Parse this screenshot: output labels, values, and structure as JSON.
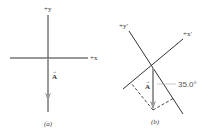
{
  "figure": {
    "panels": [
      {
        "id": "a",
        "caption": "(a)",
        "axes": {
          "y_label": "+y",
          "x_label": "+x"
        },
        "vector": {
          "label": "A",
          "arrow": "→",
          "direction": "down"
        }
      },
      {
        "id": "b",
        "caption": "(b)",
        "axes": {
          "y_label": "+y′",
          "x_label": "+x′"
        },
        "vector": {
          "label": "A",
          "arrow": "→",
          "direction": "down"
        },
        "angle_label": "35.0°"
      }
    ],
    "colors": {
      "axis": "#333333",
      "vector": "#999999",
      "dashed": "#333333"
    }
  }
}
